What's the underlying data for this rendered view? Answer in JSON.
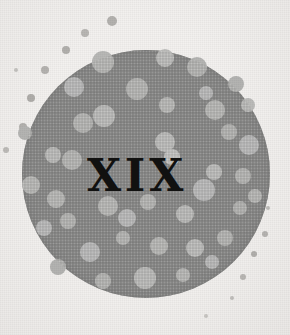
{
  "page": {
    "width": 290,
    "height": 335,
    "background_color": "#f3f1ef",
    "kind": "book-chapter-opener-ornament"
  },
  "numeral": {
    "text": "XIX",
    "meaning": "roman-numeral-nineteen",
    "color": "#111110",
    "font_size_px": 44,
    "center_x": 137,
    "center_y": 177
  },
  "disc": {
    "name": "halftone-circle",
    "fill_color": "#8b8b8a",
    "edge_color": "#7f7f7e",
    "center_x": 146,
    "center_y": 174,
    "radius": 124
  },
  "dot_colors": {
    "inner_dot": "#b6b6b4",
    "inner_dot_alt": "#c0c0bd",
    "outer_dot": "#b2b0ad",
    "outer_dot_faint": "#c8c6c3"
  },
  "inner_dots": [
    {
      "cx": 103,
      "cy": 62,
      "r": 11,
      "c": "#b8b8b6"
    },
    {
      "cx": 165,
      "cy": 58,
      "r": 9,
      "c": "#bdbdbb"
    },
    {
      "cx": 197,
      "cy": 67,
      "r": 10,
      "c": "#b5b5b3"
    },
    {
      "cx": 74,
      "cy": 87,
      "r": 10,
      "c": "#bababa"
    },
    {
      "cx": 137,
      "cy": 89,
      "r": 11,
      "c": "#b6b6b4"
    },
    {
      "cx": 206,
      "cy": 93,
      "r": 7,
      "c": "#bababa"
    },
    {
      "cx": 236,
      "cy": 84,
      "r": 8,
      "c": "#b4b4b2"
    },
    {
      "cx": 248,
      "cy": 105,
      "r": 7,
      "c": "#bcbcba"
    },
    {
      "cx": 104,
      "cy": 116,
      "r": 11,
      "c": "#bcbcba"
    },
    {
      "cx": 83,
      "cy": 123,
      "r": 10,
      "c": "#b6b6b4"
    },
    {
      "cx": 167,
      "cy": 105,
      "r": 8,
      "c": "#b9b9b7"
    },
    {
      "cx": 215,
      "cy": 110,
      "r": 10,
      "c": "#b8b8b6"
    },
    {
      "cx": 25,
      "cy": 133,
      "r": 7,
      "c": "#b5b5b3"
    },
    {
      "cx": 53,
      "cy": 155,
      "r": 8,
      "c": "#bcbcba"
    },
    {
      "cx": 165,
      "cy": 142,
      "r": 10,
      "c": "#bdbdbb"
    },
    {
      "cx": 172,
      "cy": 157,
      "r": 8,
      "c": "#c2c2c0"
    },
    {
      "cx": 229,
      "cy": 132,
      "r": 8,
      "c": "#b4b4b2"
    },
    {
      "cx": 249,
      "cy": 145,
      "r": 10,
      "c": "#bababa"
    },
    {
      "cx": 72,
      "cy": 160,
      "r": 10,
      "c": "#b6b6b4"
    },
    {
      "cx": 31,
      "cy": 185,
      "r": 9,
      "c": "#b9b9b7"
    },
    {
      "cx": 56,
      "cy": 199,
      "r": 9,
      "c": "#b8b8b6"
    },
    {
      "cx": 214,
      "cy": 172,
      "r": 8,
      "c": "#bdbdbb"
    },
    {
      "cx": 243,
      "cy": 176,
      "r": 8,
      "c": "#b6b6b4"
    },
    {
      "cx": 204,
      "cy": 190,
      "r": 11,
      "c": "#bababa"
    },
    {
      "cx": 68,
      "cy": 221,
      "r": 8,
      "c": "#b5b5b3"
    },
    {
      "cx": 108,
      "cy": 206,
      "r": 10,
      "c": "#b8b8b6"
    },
    {
      "cx": 127,
      "cy": 218,
      "r": 9,
      "c": "#bababa"
    },
    {
      "cx": 148,
      "cy": 202,
      "r": 8,
      "c": "#b6b6b4"
    },
    {
      "cx": 185,
      "cy": 214,
      "r": 9,
      "c": "#bcbcba"
    },
    {
      "cx": 240,
      "cy": 208,
      "r": 7,
      "c": "#b4b4b2"
    },
    {
      "cx": 90,
      "cy": 252,
      "r": 10,
      "c": "#bababa"
    },
    {
      "cx": 123,
      "cy": 238,
      "r": 7,
      "c": "#b6b6b4"
    },
    {
      "cx": 159,
      "cy": 246,
      "r": 9,
      "c": "#b8b8b6"
    },
    {
      "cx": 195,
      "cy": 248,
      "r": 9,
      "c": "#bdbdbb"
    },
    {
      "cx": 225,
      "cy": 238,
      "r": 8,
      "c": "#b5b5b3"
    },
    {
      "cx": 44,
      "cy": 228,
      "r": 8,
      "c": "#bababa"
    },
    {
      "cx": 145,
      "cy": 278,
      "r": 11,
      "c": "#bcbcba"
    },
    {
      "cx": 103,
      "cy": 281,
      "r": 8,
      "c": "#b6b6b4"
    },
    {
      "cx": 183,
      "cy": 275,
      "r": 7,
      "c": "#b9b9b7"
    },
    {
      "cx": 58,
      "cy": 267,
      "r": 8,
      "c": "#b4b4b2"
    },
    {
      "cx": 212,
      "cy": 262,
      "r": 7,
      "c": "#bababa"
    },
    {
      "cx": 255,
      "cy": 196,
      "r": 7,
      "c": "#b8b8b6"
    }
  ],
  "outer_dots": [
    {
      "cx": 112,
      "cy": 21,
      "r": 5,
      "c": "#b4b2af"
    },
    {
      "cx": 85,
      "cy": 33,
      "r": 4,
      "c": "#b9b7b4"
    },
    {
      "cx": 66,
      "cy": 50,
      "r": 4,
      "c": "#b2b0ad"
    },
    {
      "cx": 45,
      "cy": 70,
      "r": 4,
      "c": "#b5b3b0"
    },
    {
      "cx": 16,
      "cy": 70,
      "r": 2,
      "c": "#c6c4c1"
    },
    {
      "cx": 31,
      "cy": 98,
      "r": 4,
      "c": "#b0aeab"
    },
    {
      "cx": 23,
      "cy": 127,
      "r": 4,
      "c": "#b4b2af"
    },
    {
      "cx": 6,
      "cy": 150,
      "r": 3,
      "c": "#bebcb9"
    },
    {
      "cx": 265,
      "cy": 234,
      "r": 3,
      "c": "#b7b5b2"
    },
    {
      "cx": 254,
      "cy": 254,
      "r": 3,
      "c": "#b2b0ad"
    },
    {
      "cx": 243,
      "cy": 277,
      "r": 3,
      "c": "#bab8b5"
    },
    {
      "cx": 232,
      "cy": 298,
      "r": 2,
      "c": "#c2c0bd"
    },
    {
      "cx": 268,
      "cy": 208,
      "r": 2,
      "c": "#c0bebb"
    },
    {
      "cx": 206,
      "cy": 316,
      "r": 2,
      "c": "#cac8c5"
    }
  ]
}
